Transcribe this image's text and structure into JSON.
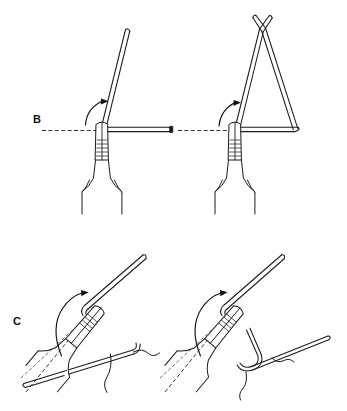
{
  "figure": {
    "background_color": "#ffffff",
    "ink_color": "#1b1b1b",
    "width": 347,
    "height": 411,
    "panels": [
      {
        "id": "B",
        "label": "B",
        "label_x": 33,
        "label_y": 123,
        "caption": "Wire gripped in plier beaks and bent upward from the horizontal",
        "steps": [
          {
            "id": "B-left",
            "name": "first-bend",
            "description": "Straight wire held horizontally in serrated plier beaks; free limb bent upward about 70 degrees while the original horizontal path is shown as a dashed ghost line",
            "instrument": "flat-nose-pliers",
            "wire_segments": [
              "horizontal-limb",
              "raised-limb"
            ],
            "ghost_lines": 1,
            "rotation_arrow": "counter-clockwise-up",
            "bend_angle_deg": 70
          },
          {
            "id": "B-right",
            "name": "closed-triangular-loop",
            "description": "Both wire limbs brought together into a closed triangle whose free ends cross above the apex; the original horizontal path remains as a dashed ghost line",
            "instrument": "flat-nose-pliers",
            "wire_segments": [
              "base-limb",
              "left-riser",
              "right-riser",
              "crossed-ends"
            ],
            "ghost_lines": 1,
            "rotation_arrow": "counter-clockwise-up",
            "bend_angle_deg": 70
          }
        ]
      },
      {
        "id": "C",
        "label": "C",
        "label_x": 13,
        "label_y": 325,
        "caption": "Oblique view of the same bend carried through a wide arc",
        "steps": [
          {
            "id": "C-left",
            "name": "oblique-bend-open",
            "description": "Obliquely angled pliers grip the wire; a long curved arrow sweeps the limb through a wide arc, the prior positions indicated by two dashed ghost lines",
            "instrument": "flat-nose-pliers",
            "wire_segments": [
              "upper-limb",
              "lower-limb"
            ],
            "ghost_lines": 2,
            "rotation_arrow": "counter-clockwise-wide-arc",
            "bend_angle_deg": 150
          },
          {
            "id": "C-right",
            "name": "oblique-bend-closed",
            "description": "Completed oblique bend; the wire doubles back around the plier beaks and the free limb runs off to the right, prior positions shown as dashed ghost lines",
            "instrument": "flat-nose-pliers",
            "wire_segments": [
              "upper-limb",
              "returned-limb",
              "right-limb"
            ],
            "ghost_lines": 2,
            "rotation_arrow": "counter-clockwise-wide-arc",
            "bend_angle_deg": 150
          }
        ]
      }
    ]
  }
}
